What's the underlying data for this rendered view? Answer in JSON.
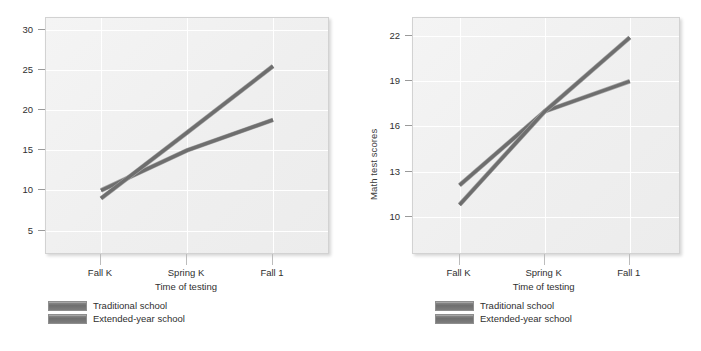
{
  "figure": {
    "background": "#ffffff",
    "line_color": "#6e6e6e",
    "plot_bg": "#f1f1f1",
    "grid_color": "#ffffff"
  },
  "legend": {
    "series": [
      {
        "name": "Traditional school",
        "color": "#6e6e6e"
      },
      {
        "name": "Extended-year school",
        "color": "#6e6e6e"
      }
    ]
  },
  "chart_data": [
    {
      "type": "line",
      "panel": "left",
      "title": "",
      "xlabel": "Time of testing",
      "ylabel": "",
      "categories": [
        "Fall K",
        "Spring K",
        "Fall 1"
      ],
      "yticks": [
        5,
        10,
        15,
        20,
        25,
        30
      ],
      "ylim": [
        2.2,
        31.5
      ],
      "grid": true,
      "legend_position": "below-axis-left",
      "series": [
        {
          "name": "Traditional school",
          "values": [
            10.0,
            15.0,
            18.8
          ]
        },
        {
          "name": "Extended-year school",
          "values": [
            9.0,
            17.2,
            25.5
          ]
        }
      ]
    },
    {
      "type": "line",
      "panel": "right",
      "title": "",
      "xlabel": "Time of testing",
      "ylabel": "Math test scores",
      "categories": [
        "Fall K",
        "Spring K",
        "Fall 1"
      ],
      "yticks": [
        10,
        13,
        16,
        19,
        22
      ],
      "ylim": [
        7.6,
        23.2
      ],
      "grid": true,
      "legend_position": "below-axis-left",
      "series": [
        {
          "name": "Traditional school",
          "values": [
            12.1,
            17.0,
            19.0
          ]
        },
        {
          "name": "Extended-year school",
          "values": [
            10.8,
            17.0,
            21.9
          ]
        }
      ]
    }
  ]
}
